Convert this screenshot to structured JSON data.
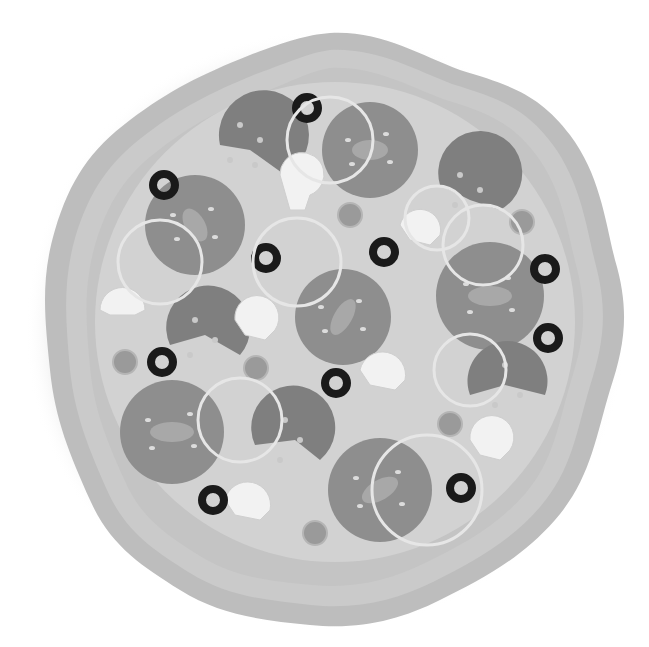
{
  "image": {
    "subject": "Pizza illustration (grayscale)",
    "colors": {
      "background": "#ffffff",
      "crust_outer": "#bdbdbd",
      "crust_ring": "#cacaca",
      "crust_inner": "#c4c4c4",
      "cheese": "#d2d2d2",
      "tomato": "#8e8e8e",
      "tomato_inner": "#a8a8a8",
      "tomato_seeds": "#dcdcdc",
      "pepperoni": "#7f7f7f",
      "pepperoni_dots": "#c9c9c9",
      "olive": "#1a1a1a",
      "mushroom": "#f2f2f2",
      "onion_ring": "#e6e6e6",
      "pepper": "#9a9a9a"
    },
    "toppings": {
      "tomato_slices": 8,
      "pepperoni_slices": 6,
      "black_olives": 9,
      "mushrooms": 7,
      "onion_rings": 7,
      "pepper_pieces": 6
    }
  }
}
